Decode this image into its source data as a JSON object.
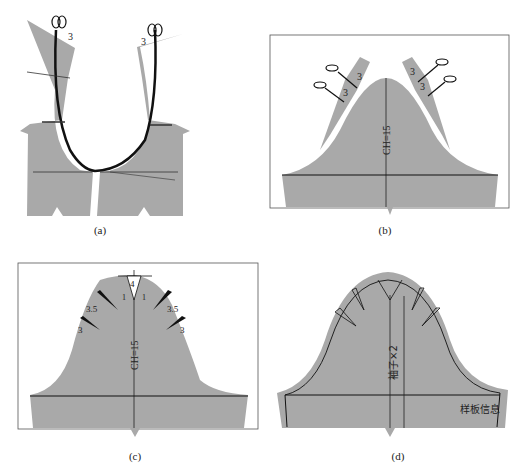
{
  "figure": {
    "colors": {
      "fabric": "#a9a9a9",
      "line": "#1a1a1a",
      "frame": "#555555",
      "background": "#ffffff"
    },
    "panels": [
      {
        "id": "a",
        "caption": "(a)",
        "description": "Sleeve pattern slashed along cap line, opened at cut points",
        "labels": [
          "3",
          "3"
        ],
        "icons": [
          "scissors-icon",
          "scissors-icon"
        ]
      },
      {
        "id": "b",
        "caption": "(b)",
        "description": "Sleeve cap with two slash wedges on each side",
        "labels": [
          "3",
          "3",
          "3",
          "3"
        ],
        "center_label": "CH=15",
        "icons": [
          "scissors-icon",
          "scissors-icon",
          "scissors-icon",
          "scissors-icon"
        ]
      },
      {
        "id": "c",
        "caption": "(c)",
        "description": "Cap spread with gathered darts",
        "labels": [
          "4",
          "3.5",
          "3.5",
          "3",
          "3",
          "1",
          "1"
        ],
        "center_label": "CH=15"
      },
      {
        "id": "d",
        "caption": "(d)",
        "description": "Final sleeve pattern with seam allowance",
        "center_label": "袖子×2",
        "info_label": "样板信息"
      }
    ]
  }
}
